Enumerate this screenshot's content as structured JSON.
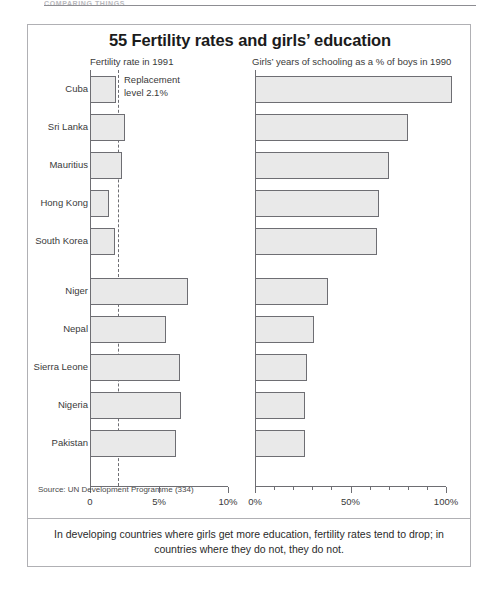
{
  "page": {
    "running_head": "COMPARING THINGS"
  },
  "figure": {
    "title": "55 Fertility rates and girls’ education",
    "left_panel_heading": "Fertility rate in 1991",
    "right_panel_heading": "Girls’ years of schooling as a % of boys in 1990",
    "annotation": {
      "line1": "Replacement",
      "line2": "level 2.1%",
      "value": 2.1
    },
    "source": "Source: UN Development Programme (334)",
    "caption": "In developing countries where girls get more education, fertility rates tend to drop; in countries where they do not, they do not.",
    "bar_fill": "#e9e9e9",
    "bar_stroke": "#6e6e73",
    "frame_color": "#b0b0b4"
  },
  "chart_data": {
    "type": "bar",
    "orientation": "horizontal",
    "title": "55 Fertility rates and girls’ education",
    "categories": [
      "Cuba",
      "Sri Lanka",
      "Mauritius",
      "Hong Kong",
      "South Korea",
      "Niger",
      "Nepal",
      "Sierra Leone",
      "Nigeria",
      "Pakistan"
    ],
    "group_break_after_index": 4,
    "series": [
      {
        "name": "Fertility rate in 1991",
        "unit": "%",
        "values": [
          1.9,
          2.5,
          2.3,
          1.4,
          1.8,
          7.1,
          5.5,
          6.5,
          6.6,
          6.2
        ],
        "axis": "left",
        "xlim": [
          0,
          10
        ],
        "xticks": [
          0,
          5,
          10
        ],
        "xticklabels": [
          "0",
          "5%",
          "10%"
        ],
        "reference_line": {
          "label": "Replacement level 2.1%",
          "value": 2.1,
          "style": "dashed"
        }
      },
      {
        "name": "Girls’ years of schooling as a % of boys in 1990",
        "unit": "%",
        "values": [
          103,
          80,
          70,
          65,
          64,
          38,
          31,
          27,
          26,
          26
        ],
        "axis": "right",
        "xlim": [
          0,
          100
        ],
        "xticks": [
          0,
          10,
          20,
          30,
          40,
          50,
          60,
          70,
          80,
          90,
          100
        ],
        "xticklabels_major": [
          "0%",
          "50%",
          "100%"
        ],
        "major_ticks": [
          0,
          50,
          100
        ]
      }
    ],
    "grid": false,
    "legend": "none",
    "xlabel": "",
    "ylabel": ""
  }
}
